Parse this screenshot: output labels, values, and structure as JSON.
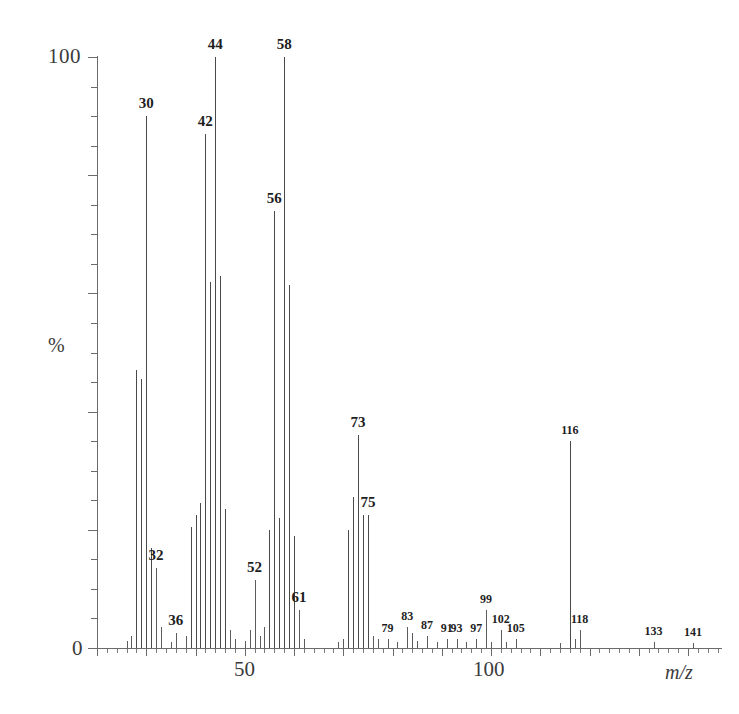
{
  "figure": {
    "kind": "mass-spectrum",
    "axis": {
      "y_label": "%",
      "y_max_label": "100",
      "y_min_label": "0",
      "x_label": "m/z",
      "x_ticks_labeled": [
        "50",
        "100"
      ]
    },
    "ink_color": "#5c5c5c",
    "text_color": "#1e1e1e"
  },
  "chart_data": {
    "type": "bar",
    "title": "",
    "subtitle": "",
    "xlabel": "m/z",
    "ylabel": "%",
    "xlim": [
      20,
      145
    ],
    "ylim": [
      0,
      100
    ],
    "grid": false,
    "legend": null,
    "x_tick_labels": [
      {
        "x": 50,
        "label": "50"
      },
      {
        "x": 100,
        "label": "100"
      }
    ],
    "y_tick_labels": [
      {
        "y": 0,
        "label": "0"
      },
      {
        "y": 100,
        "label": "100"
      }
    ],
    "x": [
      26,
      27,
      28,
      29,
      30,
      31,
      32,
      33,
      35,
      36,
      38,
      39,
      40,
      41,
      42,
      43,
      44,
      45,
      46,
      47,
      48,
      50,
      51,
      52,
      53,
      54,
      55,
      56,
      57,
      58,
      59,
      60,
      61,
      62,
      69,
      70,
      71,
      72,
      73,
      74,
      75,
      76,
      77,
      79,
      81,
      83,
      84,
      85,
      87,
      89,
      91,
      93,
      95,
      97,
      99,
      100,
      102,
      103,
      105,
      114,
      116,
      117,
      118,
      133,
      141
    ],
    "values": [
      1.2,
      2.0,
      47.0,
      45.5,
      90.0,
      17.0,
      13.5,
      3.5,
      1.0,
      2.5,
      2.0,
      20.5,
      22.5,
      24.5,
      87.0,
      62.0,
      100.0,
      63.0,
      23.5,
      3.0,
      1.5,
      1.2,
      3.0,
      11.5,
      2.0,
      3.5,
      20.0,
      74.0,
      22.0,
      100.0,
      61.5,
      19.0,
      6.5,
      1.5,
      1.0,
      1.5,
      20.0,
      25.5,
      36.0,
      22.5,
      22.5,
      2.0,
      1.5,
      1.5,
      1.0,
      3.5,
      2.5,
      1.2,
      2.0,
      1.0,
      1.5,
      1.5,
      1.0,
      1.5,
      6.5,
      1.0,
      3.0,
      1.0,
      1.5,
      0.8,
      35.0,
      1.5,
      3.0,
      1.0,
      0.8
    ],
    "annotations": [
      {
        "x": 30,
        "text": "30",
        "size": "big"
      },
      {
        "x": 32,
        "text": "32",
        "size": "big"
      },
      {
        "x": 36,
        "text": "36",
        "size": "big"
      },
      {
        "x": 42,
        "text": "42",
        "size": "big"
      },
      {
        "x": 44,
        "text": "44",
        "size": "big"
      },
      {
        "x": 52,
        "text": "52",
        "size": "big"
      },
      {
        "x": 56,
        "text": "56",
        "size": "big"
      },
      {
        "x": 58,
        "text": "58",
        "size": "big"
      },
      {
        "x": 61,
        "text": "61",
        "size": "big"
      },
      {
        "x": 73,
        "text": "73",
        "size": "big"
      },
      {
        "x": 75,
        "text": "75",
        "size": "big"
      },
      {
        "x": 79,
        "text": "79",
        "size": "small"
      },
      {
        "x": 83,
        "text": "83",
        "size": "small"
      },
      {
        "x": 87,
        "text": "87",
        "size": "small"
      },
      {
        "x": 91,
        "text": "91",
        "size": "small"
      },
      {
        "x": 93,
        "text": "93",
        "size": "small"
      },
      {
        "x": 97,
        "text": "97",
        "size": "small"
      },
      {
        "x": 99,
        "text": "99",
        "size": "small"
      },
      {
        "x": 102,
        "text": "102",
        "size": "small"
      },
      {
        "x": 105,
        "text": "105",
        "size": "small"
      },
      {
        "x": 116,
        "text": "116",
        "size": "small"
      },
      {
        "x": 118,
        "text": "118",
        "size": "small"
      },
      {
        "x": 133,
        "text": "133",
        "size": "small"
      },
      {
        "x": 141,
        "text": "141",
        "size": "small"
      }
    ]
  }
}
